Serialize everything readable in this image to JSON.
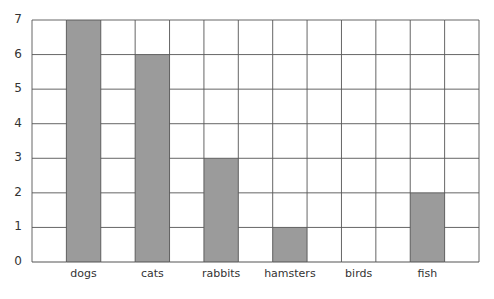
{
  "chart_data": {
    "type": "bar",
    "title": "",
    "xlabel": "",
    "ylabel": "",
    "categories": [
      "dogs",
      "cats",
      "rabbits",
      "hamsters",
      "birds",
      "fish"
    ],
    "values": [
      7,
      6,
      3,
      1,
      0,
      2
    ],
    "ylim": [
      0,
      7
    ],
    "yticks": [
      0,
      1,
      2,
      3,
      4,
      5,
      6,
      7
    ],
    "grid": true,
    "grid_columns": 13,
    "bar_color": "#9b9b9b",
    "grid_color": "#555555",
    "legend": null
  }
}
